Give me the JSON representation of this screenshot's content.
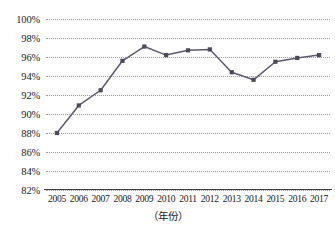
{
  "chart_data": {
    "type": "line",
    "title": "",
    "subtitle": "",
    "xlabel": "（年份）",
    "ylabel": "",
    "categories": [
      "2005",
      "2006",
      "2007",
      "2008",
      "2009",
      "2010",
      "2011",
      "2012",
      "2013",
      "2014",
      "2015",
      "2016",
      "2017"
    ],
    "x": [
      2005,
      2006,
      2007,
      2008,
      2009,
      2010,
      2011,
      2012,
      2013,
      2014,
      2015,
      2016,
      2017
    ],
    "values": [
      88.0,
      90.9,
      92.5,
      95.6,
      97.1,
      96.2,
      96.7,
      96.8,
      94.4,
      93.6,
      95.5,
      95.9,
      96.2
    ],
    "series": [
      {
        "name": "",
        "values": [
          88.0,
          90.9,
          92.5,
          95.6,
          97.1,
          96.2,
          96.7,
          96.8,
          94.4,
          93.6,
          95.5,
          95.9,
          96.2
        ]
      }
    ],
    "ylim": [
      82,
      100
    ],
    "yticks": [
      82,
      84,
      86,
      88,
      90,
      92,
      94,
      96,
      98,
      100
    ],
    "ytick_labels": [
      "82%",
      "84%",
      "86%",
      "88%",
      "90%",
      "92%",
      "94%",
      "96%",
      "98%",
      "100%"
    ],
    "grid": true,
    "grid_axis": "y",
    "grid_style": "dotted",
    "legend": false,
    "legend_position": "none",
    "marker": "square",
    "line_color": "#5a5a6e",
    "marker_color": "#4a4a5c",
    "grid_color": "#9a9a9a",
    "axis_color": "#3f3f3f",
    "background_color": "#ffffff",
    "annotations": []
  }
}
